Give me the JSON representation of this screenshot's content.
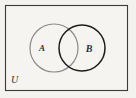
{
  "figure": {
    "kind": "venn-diagram",
    "background_color": "#f3f2ef"
  },
  "universe": {
    "label": "U",
    "border_color": "#3a3a3a",
    "fill_color": "#f5f4f1",
    "rect": {
      "x": 5,
      "y": 5,
      "width": 123,
      "height": 86
    },
    "label_position": {
      "x": 11,
      "y": 83
    }
  },
  "sets": [
    {
      "id": "A",
      "label": "A",
      "stroke_color": "#8b8b8b",
      "fill_color": "none",
      "center": {
        "x": 54,
        "y": 48
      },
      "radius": 24,
      "label_position": {
        "x": 42,
        "y": 51
      }
    },
    {
      "id": "B",
      "label": "B",
      "stroke_color": "#1d1d1d",
      "fill_color": "none",
      "center": {
        "x": 82,
        "y": 48
      },
      "radius": 23,
      "label_position": {
        "x": 89,
        "y": 52
      }
    }
  ],
  "intersection": {
    "shaded": false,
    "fill_color": "none"
  }
}
